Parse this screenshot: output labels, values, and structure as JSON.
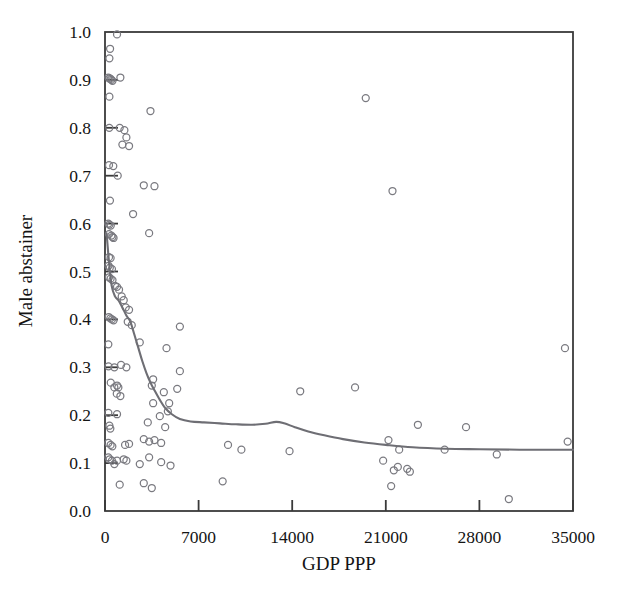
{
  "chart_data": {
    "type": "scatter",
    "title": "",
    "xlabel": "GDP PPP",
    "ylabel": "Male abstainer",
    "xlim": [
      0,
      35000
    ],
    "ylim": [
      0.0,
      1.0
    ],
    "xticks": [
      0,
      7000,
      14000,
      21000,
      28000,
      35000
    ],
    "xtick_labels": [
      "0",
      "7000",
      "14000",
      "21000",
      "28000",
      "35000"
    ],
    "yticks": [
      0.0,
      0.1,
      0.2,
      0.3,
      0.4,
      0.5,
      0.6,
      0.7,
      0.8,
      0.9,
      1.0
    ],
    "ytick_labels": [
      "0.0",
      "0.1",
      "0.2",
      "0.3",
      "0.4",
      "0.5",
      "0.6",
      "0.7",
      "0.8",
      "0.9",
      "1.0"
    ],
    "grid": false,
    "legend": false,
    "marker_style": "open-circle",
    "marker_color": "#7a7a80",
    "trend_color": "#6e6e74",
    "frame_color": "#3a3a3a",
    "background_color": "#ffffff",
    "points": [
      [
        900,
        0.995
      ],
      [
        380,
        0.965
      ],
      [
        330,
        0.945
      ],
      [
        250,
        0.905
      ],
      [
        330,
        0.903
      ],
      [
        420,
        0.902
      ],
      [
        480,
        0.9
      ],
      [
        560,
        0.898
      ],
      [
        1150,
        0.905
      ],
      [
        330,
        0.865
      ],
      [
        3400,
        0.835
      ],
      [
        320,
        0.8
      ],
      [
        1100,
        0.8
      ],
      [
        1450,
        0.795
      ],
      [
        1600,
        0.78
      ],
      [
        1300,
        0.765
      ],
      [
        1800,
        0.762
      ],
      [
        300,
        0.722
      ],
      [
        620,
        0.72
      ],
      [
        950,
        0.7
      ],
      [
        2900,
        0.68
      ],
      [
        3700,
        0.678
      ],
      [
        370,
        0.648
      ],
      [
        2100,
        0.62
      ],
      [
        250,
        0.6
      ],
      [
        330,
        0.598
      ],
      [
        430,
        0.596
      ],
      [
        300,
        0.578
      ],
      [
        480,
        0.575
      ],
      [
        560,
        0.572
      ],
      [
        640,
        0.57
      ],
      [
        3300,
        0.58
      ],
      [
        300,
        0.53
      ],
      [
        420,
        0.528
      ],
      [
        260,
        0.512
      ],
      [
        360,
        0.508
      ],
      [
        520,
        0.505
      ],
      [
        300,
        0.488
      ],
      [
        420,
        0.485
      ],
      [
        560,
        0.482
      ],
      [
        750,
        0.47
      ],
      [
        900,
        0.468
      ],
      [
        1050,
        0.462
      ],
      [
        1250,
        0.448
      ],
      [
        1400,
        0.44
      ],
      [
        280,
        0.405
      ],
      [
        400,
        0.402
      ],
      [
        520,
        0.4
      ],
      [
        640,
        0.398
      ],
      [
        1700,
        0.395
      ],
      [
        2000,
        0.388
      ],
      [
        1550,
        0.425
      ],
      [
        1800,
        0.42
      ],
      [
        5600,
        0.385
      ],
      [
        250,
        0.348
      ],
      [
        2600,
        0.352
      ],
      [
        4600,
        0.34
      ],
      [
        260,
        0.302
      ],
      [
        1600,
        0.3
      ],
      [
        1200,
        0.305
      ],
      [
        5600,
        0.292
      ],
      [
        3600,
        0.275
      ],
      [
        700,
        0.3
      ],
      [
        14600,
        0.25
      ],
      [
        18700,
        0.258
      ],
      [
        430,
        0.268
      ],
      [
        700,
        0.258
      ],
      [
        900,
        0.262
      ],
      [
        1000,
        0.258
      ],
      [
        880,
        0.245
      ],
      [
        1150,
        0.24
      ],
      [
        3500,
        0.262
      ],
      [
        4400,
        0.248
      ],
      [
        5400,
        0.255
      ],
      [
        4800,
        0.225
      ],
      [
        250,
        0.205
      ],
      [
        900,
        0.202
      ],
      [
        3600,
        0.225
      ],
      [
        4700,
        0.208
      ],
      [
        4100,
        0.198
      ],
      [
        330,
        0.178
      ],
      [
        400,
        0.172
      ],
      [
        3200,
        0.185
      ],
      [
        4500,
        0.175
      ],
      [
        23400,
        0.18
      ],
      [
        27000,
        0.175
      ],
      [
        250,
        0.142
      ],
      [
        420,
        0.138
      ],
      [
        550,
        0.135
      ],
      [
        1500,
        0.138
      ],
      [
        1800,
        0.14
      ],
      [
        2900,
        0.15
      ],
      [
        3300,
        0.145
      ],
      [
        3700,
        0.148
      ],
      [
        4200,
        0.142
      ],
      [
        9200,
        0.138
      ],
      [
        10200,
        0.128
      ],
      [
        13800,
        0.125
      ],
      [
        21200,
        0.148
      ],
      [
        22000,
        0.128
      ],
      [
        25400,
        0.128
      ],
      [
        34600,
        0.145
      ],
      [
        250,
        0.112
      ],
      [
        350,
        0.108
      ],
      [
        520,
        0.105
      ],
      [
        700,
        0.098
      ],
      [
        900,
        0.105
      ],
      [
        1400,
        0.108
      ],
      [
        1600,
        0.105
      ],
      [
        2600,
        0.098
      ],
      [
        3300,
        0.112
      ],
      [
        4200,
        0.102
      ],
      [
        4900,
        0.095
      ],
      [
        20800,
        0.105
      ],
      [
        21600,
        0.085
      ],
      [
        21900,
        0.092
      ],
      [
        22600,
        0.088
      ],
      [
        22800,
        0.082
      ],
      [
        29300,
        0.118
      ],
      [
        1100,
        0.055
      ],
      [
        2900,
        0.058
      ],
      [
        3500,
        0.048
      ],
      [
        21400,
        0.052
      ],
      [
        30200,
        0.025
      ],
      [
        34400,
        0.34
      ],
      [
        8800,
        0.062
      ],
      [
        19500,
        0.862
      ],
      [
        21500,
        0.668
      ]
    ],
    "trend_line": [
      [
        120,
        0.58
      ],
      [
        300,
        0.52
      ],
      [
        500,
        0.47
      ],
      [
        750,
        0.448
      ],
      [
        1000,
        0.44
      ],
      [
        1300,
        0.425
      ],
      [
        1600,
        0.408
      ],
      [
        1900,
        0.395
      ],
      [
        2200,
        0.368
      ],
      [
        2500,
        0.34
      ],
      [
        2800,
        0.312
      ],
      [
        3100,
        0.288
      ],
      [
        3400,
        0.268
      ],
      [
        3700,
        0.252
      ],
      [
        4100,
        0.232
      ],
      [
        4500,
        0.215
      ],
      [
        5000,
        0.202
      ],
      [
        5600,
        0.192
      ],
      [
        6400,
        0.187
      ],
      [
        7400,
        0.185
      ],
      [
        8600,
        0.183
      ],
      [
        9800,
        0.181
      ],
      [
        11000,
        0.18
      ],
      [
        12000,
        0.182
      ],
      [
        12800,
        0.186
      ],
      [
        13400,
        0.183
      ],
      [
        14200,
        0.175
      ],
      [
        15200,
        0.166
      ],
      [
        16400,
        0.158
      ],
      [
        17800,
        0.15
      ],
      [
        19400,
        0.143
      ],
      [
        21000,
        0.138
      ],
      [
        23000,
        0.133
      ],
      [
        25500,
        0.13
      ],
      [
        28000,
        0.129
      ],
      [
        31000,
        0.128
      ],
      [
        35000,
        0.128
      ]
    ]
  }
}
